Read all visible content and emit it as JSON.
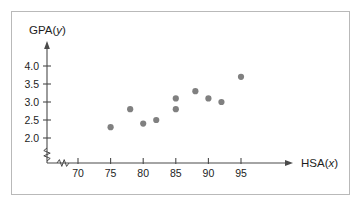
{
  "chart_data": {
    "type": "scatter",
    "title": "",
    "xlabel": "HSA(x)",
    "ylabel": "GPA(y)",
    "xlabel_prefix": "HSA(",
    "xlabel_var": "x",
    "xlabel_suffix": ")",
    "ylabel_prefix": "GPA(",
    "ylabel_var": "y",
    "ylabel_suffix": ")",
    "x_ticks": [
      70,
      75,
      80,
      85,
      90,
      95
    ],
    "y_ticks": [
      2.0,
      2.5,
      3.0,
      3.5,
      4.0
    ],
    "x_tick_labels": [
      "70",
      "75",
      "80",
      "85",
      "90",
      "95"
    ],
    "y_tick_labels": [
      "2.0",
      "2.5",
      "3.0",
      "3.5",
      "4.0"
    ],
    "xlim": [
      66.5,
      100
    ],
    "ylim": [
      1.78,
      4.25
    ],
    "axis_break_x": true,
    "axis_break_y": true,
    "grid": false,
    "legend": false,
    "point_color": "#808080",
    "axis_color": "#4a4a4a",
    "frame_color": "#b9b9b9",
    "points": [
      {
        "x": 75,
        "y": 2.3
      },
      {
        "x": 78,
        "y": 2.8
      },
      {
        "x": 80,
        "y": 2.4
      },
      {
        "x": 82,
        "y": 2.5
      },
      {
        "x": 85,
        "y": 2.8
      },
      {
        "x": 85,
        "y": 3.1
      },
      {
        "x": 88,
        "y": 3.3
      },
      {
        "x": 90,
        "y": 3.1
      },
      {
        "x": 92,
        "y": 3.0
      },
      {
        "x": 95,
        "y": 3.7
      }
    ]
  }
}
